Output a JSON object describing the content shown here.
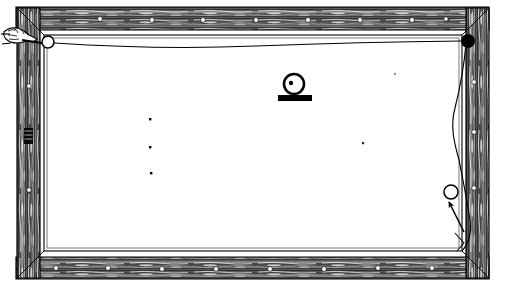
{
  "figure": {
    "title": "Wooden frame with suspended wire and pendulum bob",
    "background_color": "#ffffff",
    "ink_color": "#000000",
    "width": 505,
    "height": 286
  },
  "frame": {
    "label": "wooden-frame",
    "style": "engraved wood grain",
    "outer": {
      "x": 14,
      "y": 6,
      "width": 477,
      "height": 274
    },
    "inner": {
      "x": 44,
      "y": 36,
      "width": 417,
      "height": 214
    },
    "rails": [
      {
        "name": "top-rail",
        "label": "Top rail"
      },
      {
        "name": "bottom-rail",
        "label": "Bottom rail"
      },
      {
        "name": "left-stile",
        "label": "Left stile"
      },
      {
        "name": "right-stile",
        "label": "Right stile"
      }
    ],
    "nail_heads": {
      "label": "Nail heads",
      "top": [
        {
          "x": 100,
          "y": 19
        },
        {
          "x": 152,
          "y": 20
        },
        {
          "x": 203,
          "y": 20
        },
        {
          "x": 256,
          "y": 20
        },
        {
          "x": 308,
          "y": 20
        },
        {
          "x": 360,
          "y": 20
        },
        {
          "x": 412,
          "y": 20
        },
        {
          "x": 446,
          "y": 19
        }
      ],
      "bottom": [
        {
          "x": 56,
          "y": 268
        },
        {
          "x": 108,
          "y": 268
        },
        {
          "x": 162,
          "y": 269
        },
        {
          "x": 216,
          "y": 269
        },
        {
          "x": 270,
          "y": 269
        },
        {
          "x": 324,
          "y": 269
        },
        {
          "x": 378,
          "y": 268
        },
        {
          "x": 432,
          "y": 268
        }
      ],
      "left": [
        {
          "x": 29,
          "y": 86
        },
        {
          "x": 29,
          "y": 190
        }
      ],
      "right": [
        {
          "x": 474,
          "y": 82
        },
        {
          "x": 474,
          "y": 132
        },
        {
          "x": 474,
          "y": 188
        }
      ]
    }
  },
  "parts": {
    "left_anchor": {
      "name": "left-anchor-ring",
      "label": "Open ring anchor (left)",
      "shape": "open-circle",
      "cx": 48,
      "cy": 42,
      "r": 6,
      "fill": "#ffffff",
      "stroke": "#000000"
    },
    "right_anchor": {
      "name": "right-anchor-bead",
      "label": "Filled bead anchor (right)",
      "shape": "filled-circle",
      "cx": 468,
      "cy": 41,
      "r": 7,
      "fill": "#000000"
    },
    "suspension_wire": {
      "name": "suspension-wire",
      "label": "Suspension wire",
      "from": {
        "x": 54,
        "y": 43
      },
      "to": {
        "x": 462,
        "y": 41
      },
      "sag_depth_px": 4
    },
    "bob": {
      "name": "pendulum-bob",
      "label": "Pendulum bob on base",
      "circle": {
        "cx": 294,
        "cy": 84,
        "r": 10
      },
      "center_dot": {
        "cx": 291,
        "cy": 83,
        "r": 2
      },
      "base": {
        "x": 278,
        "y": 95,
        "width": 34,
        "height": 6
      }
    },
    "lower_right_ring": {
      "name": "lower-right-ring",
      "label": "Open ring (lower right)",
      "shape": "open-circle",
      "cx": 451,
      "cy": 192,
      "r": 7,
      "fill": "#ffffff",
      "stroke": "#000000"
    },
    "pointer_arrow": {
      "name": "pointer-arrow",
      "label": "Arrow indicating ring",
      "tail": {
        "x": 464,
        "y": 232
      },
      "head": {
        "x": 447,
        "y": 200
      }
    },
    "hanging_cord": {
      "name": "hanging-cord",
      "label": "Hanging cord along right stile",
      "points": "466,41 463,70 459,100 452,126 458,152 462,176 466,200 470,224 463,248"
    },
    "corner_grip": {
      "name": "corner-grip",
      "label": "Hand grip / knot at top-left",
      "cx": 20,
      "cy": 38
    },
    "corner_tick_bottom_right": {
      "name": "corner-tick-bottom-right",
      "label": "Corner tick mark (bottom right)",
      "points": "455,235 463,244 458,252"
    }
  },
  "speck_dots": {
    "label": "Scattered specks",
    "points": [
      {
        "x": 150,
        "y": 119
      },
      {
        "x": 150,
        "y": 147
      },
      {
        "x": 151,
        "y": 173
      },
      {
        "x": 363,
        "y": 143
      },
      {
        "x": 395,
        "y": 74
      }
    ]
  }
}
